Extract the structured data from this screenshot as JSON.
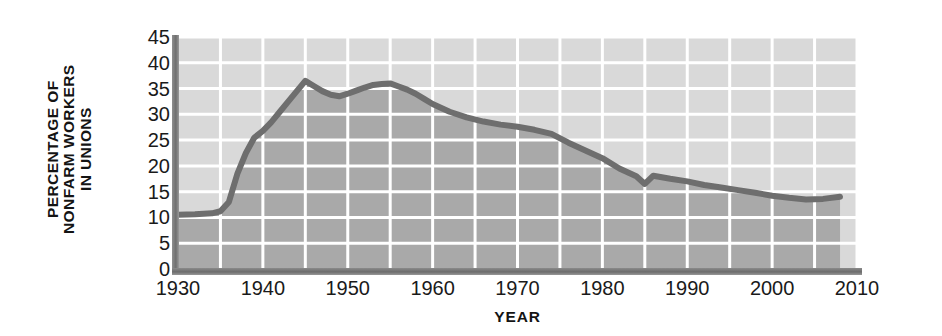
{
  "chart_data": {
    "type": "area",
    "title": "",
    "subtitle": "",
    "xlabel": "YEAR",
    "ylabel": "PERCENTAGE OF NONFARM WORKERS IN UNIONS",
    "ylabel_lines": [
      "PERCENTAGE OF",
      "NONFARM WORKERS",
      "IN UNIONS"
    ],
    "xlim": [
      1930,
      2010
    ],
    "ylim": [
      0,
      45
    ],
    "xticks": [
      1930,
      1940,
      1950,
      1960,
      1970,
      1980,
      1990,
      2000,
      2010
    ],
    "xtick_labels": [
      "1930",
      "1940",
      "1950",
      "1960",
      "1970",
      "1980",
      "1990",
      "2000",
      "2010"
    ],
    "yticks": [
      0,
      5,
      10,
      15,
      20,
      25,
      30,
      35,
      40,
      45
    ],
    "ytick_labels": [
      "0",
      "5",
      "10",
      "15",
      "20",
      "25",
      "30",
      "35",
      "40",
      "45"
    ],
    "grid": true,
    "grid_x_step": 5,
    "grid_y_step": 5,
    "legend": null,
    "legend_position": "none",
    "annotations": [],
    "series": [
      {
        "name": "Percentage of nonfarm workers in unions",
        "x": [
          1930,
          1932,
          1934,
          1935,
          1936,
          1937,
          1938,
          1939,
          1940,
          1941,
          1942,
          1943,
          1944,
          1945,
          1946,
          1947,
          1948,
          1949,
          1950,
          1951,
          1952,
          1953,
          1954,
          1955,
          1956,
          1957,
          1958,
          1959,
          1960,
          1962,
          1964,
          1966,
          1968,
          1970,
          1972,
          1974,
          1976,
          1978,
          1980,
          1982,
          1984,
          1985,
          1986,
          1988,
          1990,
          1992,
          1994,
          1996,
          1998,
          2000,
          2002,
          2004,
          2006,
          2008
        ],
        "y": [
          10.5,
          10.6,
          10.8,
          11.2,
          13.0,
          18.5,
          22.5,
          25.5,
          26.8,
          28.5,
          30.5,
          32.5,
          34.5,
          36.5,
          35.5,
          34.5,
          33.8,
          33.5,
          34.0,
          34.6,
          35.2,
          35.7,
          35.9,
          36.0,
          35.4,
          34.8,
          34.0,
          33.0,
          32.0,
          30.5,
          29.4,
          28.6,
          28.0,
          27.6,
          27.0,
          26.2,
          24.5,
          23.0,
          21.5,
          19.5,
          18.0,
          16.5,
          18.1,
          17.5,
          17.0,
          16.3,
          15.8,
          15.3,
          14.8,
          14.2,
          13.8,
          13.5,
          13.6,
          14.0
        ]
      }
    ],
    "colors": {
      "line": "#6e6e6e",
      "fill_below": "#a9a9a9",
      "fill_above": "#d9d9d9",
      "gridline": "#ffffff",
      "axis_spine": "#707070",
      "text": "#1a1a1a"
    },
    "notes": {
      "peak_value": 36.5,
      "peak_year": 1945,
      "secondary_peak_value": 36.0,
      "secondary_peak_year": 1955,
      "dip_year": 1985,
      "dip_value": 16.5,
      "final_year": 2008,
      "final_value": 14.0,
      "start_year": 1930,
      "start_value": 10.5
    }
  }
}
